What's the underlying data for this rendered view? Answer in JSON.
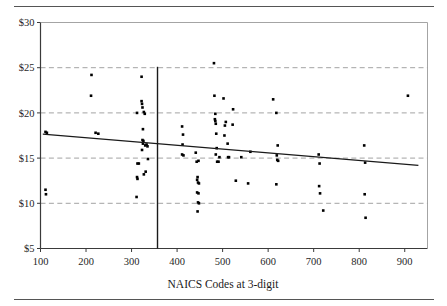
{
  "figure": {
    "top_rule": "",
    "bottom_rule": ""
  },
  "chart_data": {
    "type": "scatter",
    "title": "",
    "xlabel": "NAICS Codes at 3-digit",
    "ylabel": "",
    "xlim": [
      100,
      950
    ],
    "ylim": [
      5,
      30
    ],
    "xticks": [
      100,
      200,
      300,
      400,
      500,
      600,
      700,
      800,
      900
    ],
    "xtick_labels": [
      "100",
      "200",
      "300",
      "400",
      "500",
      "600",
      "700",
      "800",
      "900"
    ],
    "yticks": [
      5,
      10,
      15,
      20,
      25,
      30
    ],
    "ytick_labels": [
      "$5",
      "$10",
      "$15",
      "$20",
      "$25",
      "$30"
    ],
    "grid": "horizontal-dashed",
    "legend": "none",
    "series": [
      {
        "name": "Wage by NAICS code",
        "marker": "filled-square",
        "color": "#000000",
        "points": [
          [
            111,
            17.9
          ],
          [
            114,
            17.8
          ],
          [
            111,
            11.5
          ],
          [
            112,
            11.0
          ],
          [
            212,
            24.2
          ],
          [
            211,
            21.9
          ],
          [
            221,
            17.8
          ],
          [
            227,
            17.7
          ],
          [
            312,
            20.0
          ],
          [
            313,
            14.4
          ],
          [
            316,
            14.4
          ],
          [
            312,
            12.9
          ],
          [
            313,
            12.7
          ],
          [
            311,
            10.7
          ],
          [
            322,
            24.0
          ],
          [
            322,
            21.3
          ],
          [
            323,
            21.0
          ],
          [
            324,
            20.6
          ],
          [
            327,
            20.1
          ],
          [
            329,
            19.9
          ],
          [
            325,
            18.2
          ],
          [
            324,
            17.0
          ],
          [
            326,
            16.9
          ],
          [
            325,
            16.6
          ],
          [
            323,
            15.9
          ],
          [
            330,
            16.4
          ],
          [
            333,
            16.5
          ],
          [
            331,
            13.5
          ],
          [
            336,
            14.9
          ],
          [
            335,
            16.3
          ],
          [
            327,
            13.2
          ],
          [
            411,
            18.5
          ],
          [
            413,
            17.6
          ],
          [
            412,
            16.5
          ],
          [
            411,
            15.4
          ],
          [
            414,
            15.3
          ],
          [
            441,
            15.6
          ],
          [
            443,
            14.6
          ],
          [
            447,
            14.7
          ],
          [
            445,
            12.9
          ],
          [
            444,
            12.6
          ],
          [
            446,
            12.3
          ],
          [
            448,
            12.2
          ],
          [
            444,
            11.2
          ],
          [
            447,
            11.1
          ],
          [
            446,
            10.1
          ],
          [
            448,
            10.0
          ],
          [
            445,
            9.1
          ],
          [
            481,
            25.5
          ],
          [
            482,
            21.9
          ],
          [
            484,
            19.9
          ],
          [
            483,
            19.3
          ],
          [
            484,
            19.1
          ],
          [
            485,
            18.8
          ],
          [
            486,
            17.7
          ],
          [
            487,
            16.1
          ],
          [
            485,
            15.4
          ],
          [
            488,
            14.6
          ],
          [
            491,
            14.6
          ],
          [
            493,
            15.1
          ],
          [
            502,
            21.6
          ],
          [
            505,
            18.6
          ],
          [
            504,
            17.5
          ],
          [
            507,
            19.0
          ],
          [
            511,
            16.6
          ],
          [
            512,
            15.1
          ],
          [
            514,
            15.1
          ],
          [
            523,
            20.4
          ],
          [
            522,
            18.7
          ],
          [
            529,
            12.5
          ],
          [
            541,
            15.1
          ],
          [
            556,
            12.2
          ],
          [
            561,
            15.7
          ],
          [
            611,
            21.5
          ],
          [
            618,
            20.0
          ],
          [
            621,
            16.4
          ],
          [
            619,
            15.3
          ],
          [
            620,
            14.8
          ],
          [
            622,
            14.7
          ],
          [
            618,
            12.1
          ],
          [
            711,
            15.4
          ],
          [
            713,
            14.4
          ],
          [
            712,
            11.9
          ],
          [
            714,
            11.1
          ],
          [
            721,
            9.2
          ],
          [
            811,
            16.4
          ],
          [
            813,
            14.5
          ],
          [
            812,
            11.0
          ],
          [
            814,
            8.4
          ],
          [
            907,
            21.9
          ]
        ]
      }
    ],
    "trendline": {
      "name": "linear fit",
      "x_start": 105,
      "y_start": 17.65,
      "x_end": 930,
      "y_end": 14.2,
      "color": "#1a1a1a"
    },
    "reference_line": {
      "name": "vertical divider",
      "x": 357,
      "y_bottom": 5,
      "y_top": 25.1,
      "color": "#1a1a1a"
    }
  }
}
